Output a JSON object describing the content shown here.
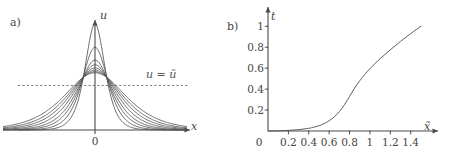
{
  "figure": {
    "panels": [
      {
        "tag": "a)",
        "axis_y_label": "u",
        "axis_x_label": "x",
        "origin_label": "0",
        "annotation": "u = ũ",
        "dashed_line_value": 0.42
      },
      {
        "tag": "b)",
        "axis_y_label": "t",
        "axis_x_label": "x̃",
        "origin_label": "0",
        "yticks": [
          "0.2",
          "0.4",
          "0.6",
          "0.8",
          "1"
        ],
        "xticks": [
          "0.2",
          "0.4",
          "0.6",
          "0.8",
          "1",
          "1.2",
          "1.4"
        ]
      }
    ]
  },
  "chart_data": [
    {
      "type": "line",
      "title": "",
      "xlabel": "x",
      "ylabel": "u",
      "grid": false,
      "legend": "none",
      "annotations": [
        {
          "text": "u = ũ",
          "kind": "dashed-horizontal-line",
          "y": 0.42
        }
      ],
      "xlim": [
        -1.0,
        1.0
      ],
      "ylim": [
        0.0,
        1.0
      ],
      "description": "Family of eight symmetric bell-shaped (soliton-like) profiles u(x) of decreasing peak amplitude and increasing width, all crossing above the dashed reference level u = u-tilde.",
      "series": [
        {
          "name": "profile-1",
          "peak": 1.0,
          "halfwidth": 0.115
        },
        {
          "name": "profile-2",
          "peak": 0.78,
          "halfwidth": 0.15
        },
        {
          "name": "profile-3",
          "peak": 0.66,
          "halfwidth": 0.185
        },
        {
          "name": "profile-4",
          "peak": 0.615,
          "halfwidth": 0.215
        },
        {
          "name": "profile-5",
          "peak": 0.585,
          "halfwidth": 0.25
        },
        {
          "name": "profile-6",
          "peak": 0.565,
          "halfwidth": 0.285
        },
        {
          "name": "profile-7",
          "peak": 0.55,
          "halfwidth": 0.32
        },
        {
          "name": "profile-8",
          "peak": 0.54,
          "halfwidth": 0.36
        }
      ]
    },
    {
      "type": "line",
      "title": "",
      "xlabel": "x̃",
      "ylabel": "t",
      "grid": false,
      "legend": "none",
      "xlim": [
        0,
        1.55
      ],
      "ylim": [
        0,
        1.05
      ],
      "xticks": [
        0,
        0.2,
        0.4,
        0.6,
        0.8,
        1.0,
        1.2,
        1.4
      ],
      "yticks": [
        0.2,
        0.4,
        0.6,
        0.8,
        1.0
      ],
      "description": "Monotone increasing S-shaped curve t(x-tilde) starting near zero, with an inflection around x-tilde = 0.8, reaching t = 1 at x-tilde = 1.5.",
      "x": [
        0.0,
        0.1,
        0.2,
        0.3,
        0.4,
        0.45,
        0.5,
        0.55,
        0.6,
        0.65,
        0.7,
        0.75,
        0.8,
        0.85,
        0.9,
        0.95,
        1.0,
        1.1,
        1.2,
        1.3,
        1.4,
        1.5
      ],
      "y": [
        0.0,
        0.002,
        0.006,
        0.013,
        0.026,
        0.036,
        0.05,
        0.07,
        0.098,
        0.135,
        0.185,
        0.25,
        0.33,
        0.41,
        0.48,
        0.54,
        0.595,
        0.69,
        0.775,
        0.855,
        0.93,
        1.0
      ]
    }
  ]
}
